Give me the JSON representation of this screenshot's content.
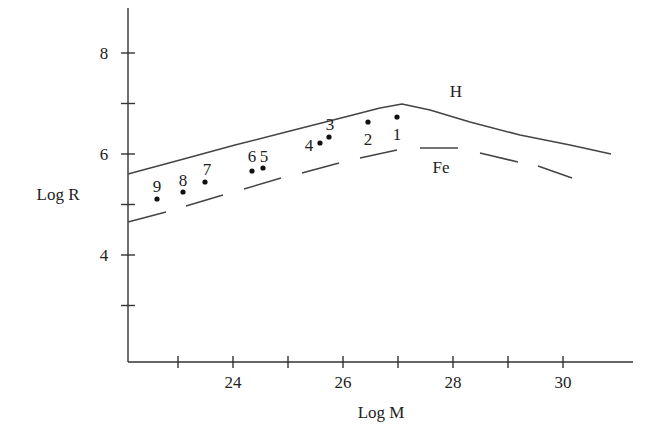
{
  "chart_data": {
    "type": "line",
    "title": "",
    "xlabel": "Log M",
    "ylabel": "Log R",
    "xlim": [
      22.1,
      31.4
    ],
    "ylim": [
      2.1,
      8.6
    ],
    "x_ticks": [
      23,
      24,
      25,
      26,
      27,
      28,
      29,
      30
    ],
    "x_tick_labels": [
      "24",
      "26",
      "28",
      "30"
    ],
    "y_ticks": [
      3,
      4,
      5,
      6,
      7,
      8
    ],
    "y_tick_labels": [
      "4",
      "6",
      "8"
    ],
    "grid": false,
    "legend": "none (curves labeled inline)",
    "series": [
      {
        "name": "H",
        "style": "solid",
        "x": [
          22.1,
          23,
          24,
          25,
          26,
          27,
          28,
          29,
          30,
          31
        ],
        "y": [
          5.6,
          5.95,
          6.3,
          6.6,
          6.85,
          6.97,
          6.8,
          6.5,
          6.25,
          6.0
        ]
      },
      {
        "name": "Fe",
        "style": "dashed",
        "x": [
          22.1,
          23,
          24,
          25,
          26,
          27,
          27.5,
          28,
          29,
          30
        ],
        "y": [
          4.65,
          4.95,
          5.3,
          5.6,
          5.85,
          6.05,
          6.1,
          6.05,
          5.85,
          5.55
        ]
      }
    ],
    "points": [
      {
        "label": "1",
        "x": 27.0,
        "y": 6.72
      },
      {
        "label": "2",
        "x": 26.5,
        "y": 6.62
      },
      {
        "label": "3",
        "x": 25.75,
        "y": 6.32
      },
      {
        "label": "4",
        "x": 25.6,
        "y": 6.22
      },
      {
        "label": "5",
        "x": 24.55,
        "y": 5.72
      },
      {
        "label": "6",
        "x": 24.35,
        "y": 5.66
      },
      {
        "label": "7",
        "x": 23.45,
        "y": 5.45
      },
      {
        "label": "8",
        "x": 23.05,
        "y": 5.25
      },
      {
        "label": "9",
        "x": 22.6,
        "y": 5.12
      }
    ],
    "annotations": [
      "H",
      "Fe"
    ]
  }
}
